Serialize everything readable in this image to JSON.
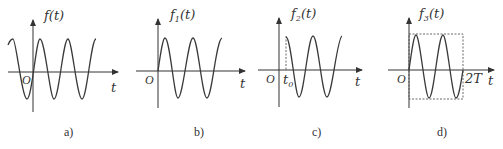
{
  "figure": {
    "panels": [
      {
        "id": "a",
        "caption": "a)",
        "function_label": "f(t)",
        "origin_label": "O",
        "axis_label": "t",
        "description": "cosine-like periodic wave extending on both sides of the origin"
      },
      {
        "id": "b",
        "caption": "b)",
        "function_label": "f1(t)",
        "function_base": "f",
        "function_sub": "1",
        "function_arg": "(t)",
        "origin_label": "O",
        "axis_label": "t",
        "description": "sine wave starting at origin (causal)"
      },
      {
        "id": "c",
        "caption": "c)",
        "function_label": "f2(t)",
        "function_base": "f",
        "function_sub": "2",
        "function_arg": "(t)",
        "origin_label": "O",
        "axis_label": "t",
        "marker_label": "t0",
        "marker_base": "t",
        "marker_sub": "0",
        "description": "cosine-like wave starting at t0 with dashed vertical line"
      },
      {
        "id": "d",
        "caption": "d)",
        "function_label": "f3(t)",
        "function_base": "f",
        "function_sub": "3",
        "function_arg": "(t)",
        "origin_label": "O",
        "axis_label": "t",
        "marker_label": "2T",
        "description": "sine wave from 0 to 2T enclosed in dashed rectangle"
      }
    ]
  }
}
